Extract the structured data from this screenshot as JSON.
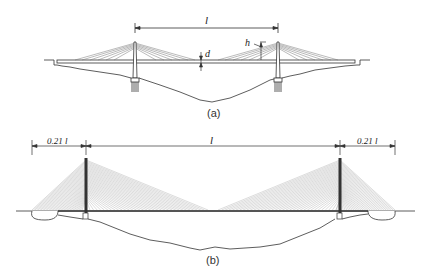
{
  "figure_a": {
    "caption": "(a)",
    "span_label": "l",
    "deck_depth_label": "d",
    "tower_height_label": "h"
  },
  "figure_b": {
    "caption": "(b)",
    "left_side_span_label": "0.21 l",
    "main_span_label": "l",
    "right_side_span_label": "0.21 l"
  },
  "colors": {
    "line": "#333333",
    "cable": "#888888",
    "background": "#ffffff"
  }
}
